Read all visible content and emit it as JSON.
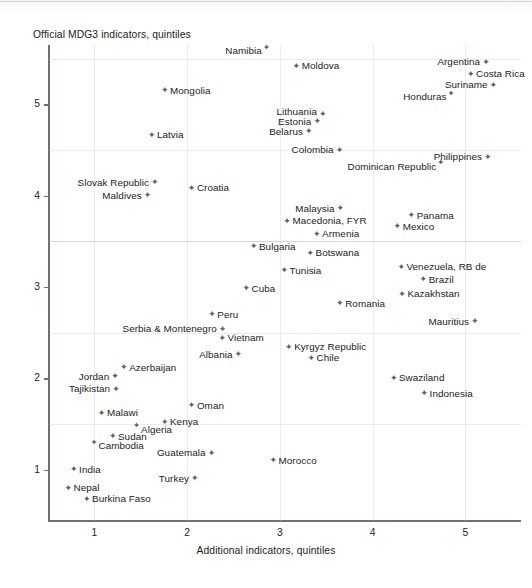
{
  "chart_data": {
    "type": "scatter",
    "title": "",
    "xlabel": "Additional indicators, quintiles",
    "ylabel": "Official MDG3 indicators, quintiles",
    "xlim": [
      0.5,
      5.6
    ],
    "ylim": [
      0.45,
      5.65
    ],
    "xticks": [
      "1",
      "2",
      "3",
      "4",
      "5"
    ],
    "yticks": [
      "1",
      "2",
      "3",
      "4",
      "5"
    ],
    "grid": "faint quintile gridlines, both axes",
    "legend": "none",
    "marker": "small four-pointed star",
    "points": [
      {
        "label": "Namibia",
        "x": 2.85,
        "y": 5.58,
        "lp": "sl-right"
      },
      {
        "label": "Moldova",
        "x": 3.18,
        "y": 5.42,
        "lp": "left"
      },
      {
        "label": "Argentina",
        "x": 5.22,
        "y": 5.46,
        "lp": "right"
      },
      {
        "label": "Costa Rica",
        "x": 5.06,
        "y": 5.33,
        "lp": "left"
      },
      {
        "label": "Mongolia",
        "x": 1.76,
        "y": 5.15,
        "lp": "left"
      },
      {
        "label": "Suriname",
        "x": 5.3,
        "y": 5.21,
        "lp": "right"
      },
      {
        "label": "Honduras",
        "x": 4.84,
        "y": 5.08,
        "lp": "sup-right"
      },
      {
        "label": "Lithuania",
        "x": 3.46,
        "y": 4.92,
        "lp": "right-low"
      },
      {
        "label": "Estonia",
        "x": 3.4,
        "y": 4.81,
        "lp": "right"
      },
      {
        "label": "Belarus",
        "x": 3.31,
        "y": 4.7,
        "lp": "right"
      },
      {
        "label": "Latvia",
        "x": 1.62,
        "y": 4.66,
        "lp": "left"
      },
      {
        "label": "Colombia",
        "x": 3.64,
        "y": 4.5,
        "lp": "right"
      },
      {
        "label": "Philippines",
        "x": 5.24,
        "y": 4.42,
        "lp": "right"
      },
      {
        "label": "Dominican Republic",
        "x": 4.73,
        "y": 4.32,
        "lp": "sup-right"
      },
      {
        "label": "Slovak Republic",
        "x": 1.65,
        "y": 4.14,
        "lp": "right"
      },
      {
        "label": "Croatia",
        "x": 2.05,
        "y": 4.08,
        "lp": "left"
      },
      {
        "label": "Maldives",
        "x": 1.57,
        "y": 4.0,
        "lp": "right"
      },
      {
        "label": "Malaysia",
        "x": 3.65,
        "y": 3.86,
        "lp": "right"
      },
      {
        "label": "Panama",
        "x": 4.42,
        "y": 3.78,
        "lp": "left"
      },
      {
        "label": "Macedonia, FYR",
        "x": 3.08,
        "y": 3.72,
        "lp": "left"
      },
      {
        "label": "Mexico",
        "x": 4.27,
        "y": 3.66,
        "lp": "left"
      },
      {
        "label": "Armenia",
        "x": 3.4,
        "y": 3.58,
        "lp": "left"
      },
      {
        "label": "Bulgaria",
        "x": 2.72,
        "y": 3.44,
        "lp": "left"
      },
      {
        "label": "Botswana",
        "x": 3.33,
        "y": 3.37,
        "lp": "left"
      },
      {
        "label": "Venezuela, RB de",
        "x": 4.31,
        "y": 3.22,
        "lp": "left"
      },
      {
        "label": "Tunisia",
        "x": 3.05,
        "y": 3.18,
        "lp": "left"
      },
      {
        "label": "Brazil",
        "x": 4.55,
        "y": 3.08,
        "lp": "left"
      },
      {
        "label": "Cuba",
        "x": 2.64,
        "y": 2.98,
        "lp": "left"
      },
      {
        "label": "Kazakhstan",
        "x": 4.32,
        "y": 2.92,
        "lp": "left"
      },
      {
        "label": "Romania",
        "x": 3.65,
        "y": 2.82,
        "lp": "left"
      },
      {
        "label": "Peru",
        "x": 2.27,
        "y": 2.7,
        "lp": "left"
      },
      {
        "label": "Mauritius",
        "x": 5.1,
        "y": 2.62,
        "lp": "right"
      },
      {
        "label": "Serbia & Montenegro",
        "x": 2.38,
        "y": 2.54,
        "lp": "right"
      },
      {
        "label": "Vietnam",
        "x": 2.38,
        "y": 2.44,
        "lp": "left"
      },
      {
        "label": "Kyrgyz Republic",
        "x": 3.1,
        "y": 2.34,
        "lp": "left"
      },
      {
        "label": "Albania",
        "x": 2.55,
        "y": 2.26,
        "lp": "right"
      },
      {
        "label": "Chile",
        "x": 3.34,
        "y": 2.22,
        "lp": "left"
      },
      {
        "label": "Azerbaijan",
        "x": 1.32,
        "y": 2.12,
        "lp": "left"
      },
      {
        "label": "Jordan",
        "x": 1.22,
        "y": 2.02,
        "lp": "right"
      },
      {
        "label": "Swaziland",
        "x": 4.23,
        "y": 2.0,
        "lp": "left"
      },
      {
        "label": "Tajikistan",
        "x": 1.23,
        "y": 1.88,
        "lp": "right"
      },
      {
        "label": "Indonesia",
        "x": 4.56,
        "y": 1.83,
        "lp": "left"
      },
      {
        "label": "Oman",
        "x": 2.05,
        "y": 1.7,
        "lp": "left"
      },
      {
        "label": "Malawi",
        "x": 1.08,
        "y": 1.62,
        "lp": "left"
      },
      {
        "label": "Kenya",
        "x": 1.76,
        "y": 1.52,
        "lp": "left"
      },
      {
        "label": "Algeria",
        "x": 1.46,
        "y": 1.44,
        "lp": "sup-left"
      },
      {
        "label": "Sudan",
        "x": 1.2,
        "y": 1.36,
        "lp": "left"
      },
      {
        "label": "Cambodia",
        "x": 1.0,
        "y": 1.26,
        "lp": "sup-left"
      },
      {
        "label": "Guatemala",
        "x": 2.26,
        "y": 1.18,
        "lp": "right"
      },
      {
        "label": "Morocco",
        "x": 2.93,
        "y": 1.1,
        "lp": "left"
      },
      {
        "label": "India",
        "x": 0.78,
        "y": 1.0,
        "lp": "left"
      },
      {
        "label": "Turkey",
        "x": 2.08,
        "y": 0.9,
        "lp": "right"
      },
      {
        "label": "Nepal",
        "x": 0.72,
        "y": 0.8,
        "lp": "left"
      },
      {
        "label": "Burkina Faso",
        "x": 0.92,
        "y": 0.68,
        "lp": "left"
      }
    ]
  },
  "axes": {
    "y_title": "Official MDG3 indicators, quintiles",
    "x_title": "Additional indicators, quintiles",
    "y_tick_labels": [
      "5",
      "4",
      "3",
      "2",
      "1"
    ],
    "x_tick_labels": [
      "1",
      "2",
      "3",
      "4",
      "5"
    ]
  },
  "style": {
    "axis_color": "#6e7175",
    "text_color": "#1b1b1b",
    "marker_color": "#5d6166",
    "grid_color": "#cdcfd2",
    "background": "#ffffff"
  }
}
